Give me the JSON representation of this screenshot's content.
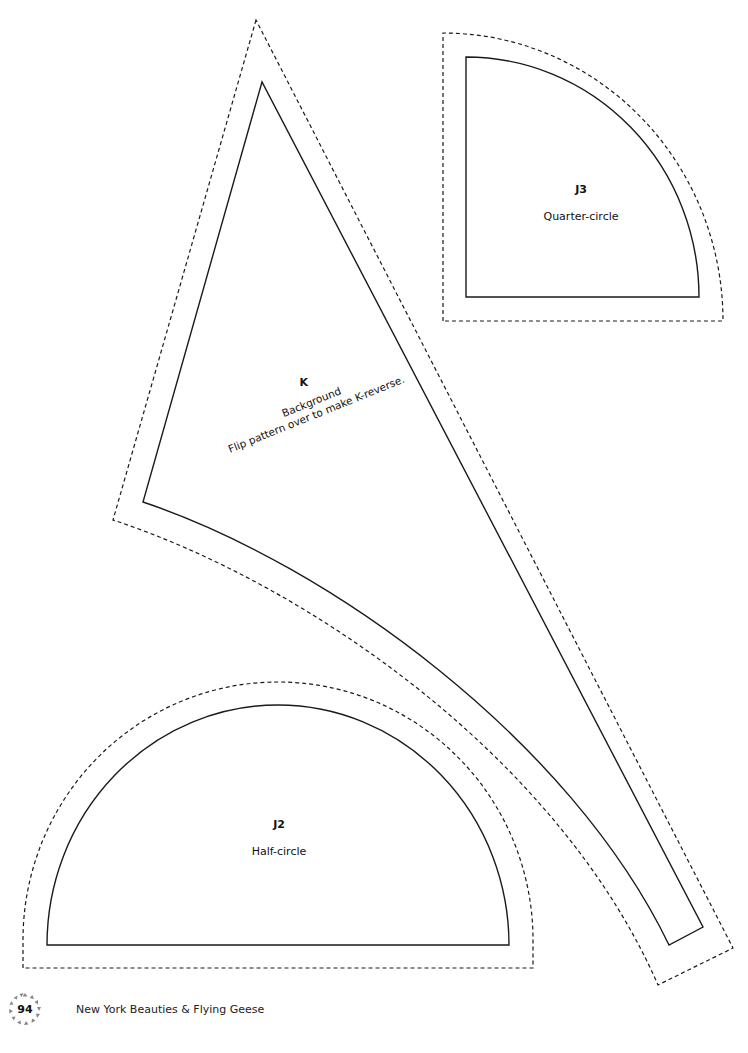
{
  "pieces": {
    "K": {
      "id": "K",
      "fabric": "Background",
      "note": "Flip pattern over to make K-reverse."
    },
    "J3": {
      "id": "J3",
      "shape": "Quarter-circle"
    },
    "J2": {
      "id": "J2",
      "shape": "Half-circle"
    }
  },
  "footer": {
    "page_number": "94",
    "book_title": "New York Beauties & Flying Geese"
  },
  "colors": {
    "line": "#1a1a1a",
    "background": "#ffffff",
    "badge_triangles": "#888888"
  }
}
